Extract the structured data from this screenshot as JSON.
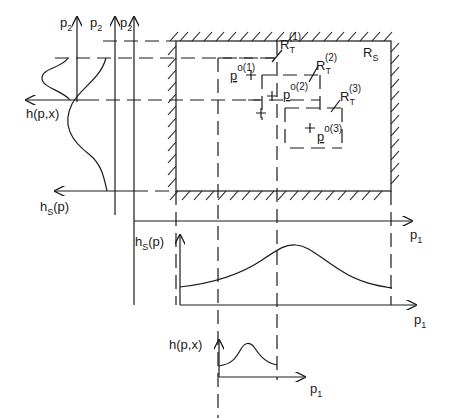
{
  "diagram": {
    "left_axes": {
      "labels": [
        {
          "base": "p",
          "sub": "2"
        },
        {
          "base": "p",
          "sub": "2"
        },
        {
          "base": "p",
          "sub": "2"
        }
      ],
      "h_px_label": "h(p,x)",
      "hs_label": {
        "base": "h",
        "sub": "S",
        "tail": "(p)"
      }
    },
    "region": {
      "label": {
        "base": "R",
        "sub": "S"
      },
      "targets": [
        {
          "label": {
            "base": "R",
            "sub": "T",
            "sup": "(1)"
          },
          "point": {
            "base": "p",
            "sup": "o(1)"
          }
        },
        {
          "label": {
            "base": "R",
            "sub": "T",
            "sup": "(2)"
          },
          "point": {
            "base": "p",
            "sup": "o(2)"
          }
        },
        {
          "label": {
            "base": "R",
            "sub": "T",
            "sup": "(3)"
          },
          "point": {
            "base": "p",
            "sup": "o(3)"
          }
        }
      ]
    },
    "main_axis": {
      "label": {
        "base": "p",
        "sub": "1"
      }
    },
    "hs_plot": {
      "ylabel": {
        "base": "h",
        "sub": "S",
        "tail": "(p)"
      },
      "xlabel": {
        "base": "p",
        "sub": "1"
      }
    },
    "h_plot": {
      "ylabel": "h(p,x)",
      "xlabel": {
        "base": "p",
        "sub": "1"
      }
    }
  }
}
